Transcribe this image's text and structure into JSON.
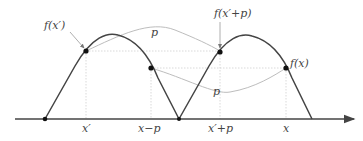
{
  "diagram": {
    "labels": {
      "f_xprime": "f(x′)",
      "f_xprime_plus_p": "f(x′+p)",
      "f_x": "f(x)",
      "p_top": "p",
      "p_bottom": "p",
      "tick_xprime": "x′",
      "tick_x_minus_p": "x−p",
      "tick_xprime_plus_p": "x′+p",
      "tick_x": "x"
    },
    "colors": {
      "curve": "#444444",
      "axis": "#444444",
      "guide": "#c8c8c8",
      "connector": "#b4b4b4",
      "point": "#111111"
    }
  }
}
